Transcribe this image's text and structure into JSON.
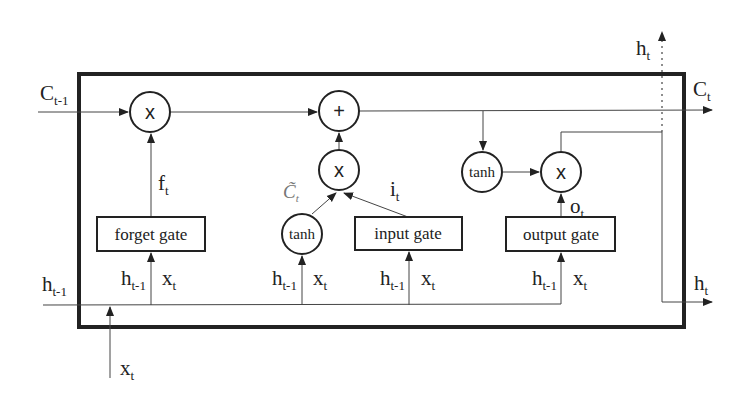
{
  "diagram": {
    "type": "LSTM cell",
    "colors": {
      "stroke": "#222222",
      "background": "#ffffff",
      "ctilde": "#777777"
    },
    "gates": {
      "forget": {
        "label": "forget gate",
        "output_symbol": "f",
        "output_sub": "t"
      },
      "input": {
        "label": "input gate",
        "output_symbol": "i",
        "output_sub": "t"
      },
      "output": {
        "label": "output gate",
        "output_symbol": "o",
        "output_sub": "t"
      }
    },
    "operators": {
      "forget_mult": "x",
      "cell_add": "+",
      "input_mult": "x",
      "output_mult": "x",
      "candidate_tanh": "tanh",
      "output_tanh": "tanh"
    },
    "candidate": {
      "symbol": "C̃",
      "sub": "t"
    },
    "gate_inputs": {
      "h": "h",
      "h_sub": "t-1",
      "x": "x",
      "x_sub": "t"
    },
    "external": {
      "c_prev": {
        "symbol": "C",
        "sub": "t-1"
      },
      "h_prev": {
        "symbol": "h",
        "sub": "t-1"
      },
      "x_in": {
        "symbol": "x",
        "sub": "t"
      },
      "c_out": {
        "symbol": "C",
        "sub": "t"
      },
      "h_out_right": {
        "symbol": "h",
        "sub": "t"
      },
      "h_out_top": {
        "symbol": "h",
        "sub": "t"
      }
    }
  }
}
